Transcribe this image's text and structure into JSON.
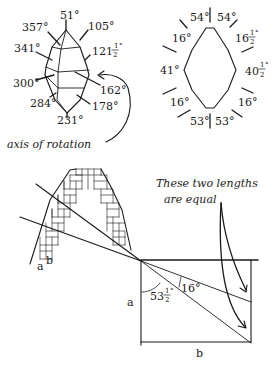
{
  "crystal_left": {
    "labels": {
      "top": "51°",
      "upper_left": "357°",
      "upper_right": "105°",
      "mid_left": "341°",
      "mid_right_whole": "121",
      "mid_right_frac_num": "1",
      "mid_right_frac_den": "2",
      "mid_right_deg": "°",
      "lower_left": "300°",
      "lower_right": "162°",
      "bottom_left": "284°",
      "bottom_right": "178°",
      "bottom": "231°"
    },
    "caption": "axis of rotation"
  },
  "crystal_right": {
    "labels": {
      "top_left": "54°",
      "top_right": "54°",
      "upper_left": "16°",
      "upper_right_whole": "16",
      "upper_right_frac_num": "1",
      "upper_right_frac_den": "2",
      "upper_right_deg": "°",
      "left": "41°",
      "right_whole": "40",
      "right_frac_num": "1",
      "right_frac_den": "2",
      "right_deg": "°",
      "lower_left": "16°",
      "lower_right": "16°",
      "bottom_left": "53°",
      "bottom_right": "53°"
    }
  },
  "bottom_diagram": {
    "note_line1": "These two lengths",
    "note_line2": "are equal",
    "grid_label_a": "a",
    "grid_label_b": "b",
    "side_label_a": "a",
    "side_label_b": "b",
    "angle_1_whole": "53",
    "angle_1_frac_num": "1",
    "angle_1_frac_den": "2",
    "angle_1_deg": "°",
    "angle_2": "16°"
  }
}
